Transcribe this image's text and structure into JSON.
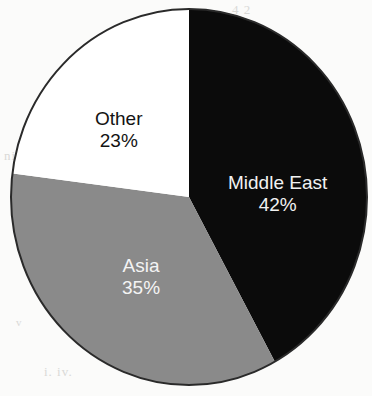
{
  "chart_data": {
    "type": "pie",
    "title": "",
    "subtitle": "",
    "xlabel": "",
    "ylabel": "",
    "legend_position": "none",
    "grid": false,
    "labels_inside": true,
    "value_suffix": "%",
    "start_angle_deg": 0,
    "direction": "clockwise",
    "categories": [
      "Middle East",
      "Asia",
      "Other"
    ],
    "values": [
      42,
      35,
      23
    ],
    "slices": [
      {
        "name": "Middle East",
        "value": 42,
        "value_label": "42%",
        "color": "#0b0b0b",
        "text_color": "#f2f2f2",
        "start_angle_deg": 0,
        "end_angle_deg": 151.2
      },
      {
        "name": "Asia",
        "value": 35,
        "value_label": "35%",
        "color": "#8a8a8a",
        "text_color": "#f4f4f4",
        "start_angle_deg": 151.2,
        "end_angle_deg": 277.2
      },
      {
        "name": "Other",
        "value": 23,
        "value_label": "23%",
        "color": "#ffffff",
        "text_color": "#131313",
        "start_angle_deg": 277.2,
        "end_angle_deg": 360
      }
    ]
  },
  "figure": {
    "background": "#fbfbfa",
    "outline_color": "#2a2a2a"
  },
  "artifacts": {
    "top_right": "4 2",
    "mid_left": "nic n",
    "bottom": "i. iv.",
    "bottom_left": "v"
  }
}
